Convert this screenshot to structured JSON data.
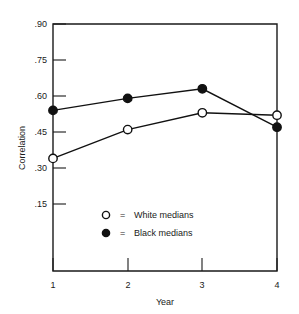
{
  "chart_data": {
    "type": "line",
    "title": "",
    "xlabel": "Year",
    "ylabel": "Correlation",
    "x": [
      1,
      2,
      3,
      4
    ],
    "xtick_labels": [
      "1",
      "2",
      "3",
      "4"
    ],
    "ytick_labels": [
      ".90",
      ".75",
      ".60",
      ".45",
      ".30",
      ".15"
    ],
    "ytick_values": [
      0.9,
      0.75,
      0.6,
      0.45,
      0.3,
      0.15
    ],
    "xlim": [
      1,
      4
    ],
    "ylim": [
      0.0,
      0.9
    ],
    "grid": false,
    "legend_position": "inside-lower-left",
    "series": [
      {
        "name": "White medians",
        "marker": "open-circle",
        "values": [
          0.34,
          0.46,
          0.53,
          0.52
        ]
      },
      {
        "name": "Black medians",
        "marker": "filled-circle",
        "values": [
          0.54,
          0.59,
          0.63,
          0.47
        ]
      }
    ],
    "legend": [
      {
        "symbol": "open-circle",
        "equals": "=",
        "label": "White  medians"
      },
      {
        "symbol": "filled-circle",
        "equals": "=",
        "label": "Black  medians"
      }
    ],
    "colors": {
      "line": "#111111",
      "open_marker_fill": "#ffffff",
      "filled_marker_fill": "#111111",
      "axis": "#1a1a1a",
      "background": "#ffffff"
    }
  },
  "axis": {
    "y_title": "Correlation",
    "x_title": "Year",
    "y_ticks": [
      {
        "label": ".90"
      },
      {
        "label": ".75"
      },
      {
        "label": ".60"
      },
      {
        "label": ".45"
      },
      {
        "label": ".30"
      },
      {
        "label": ".15"
      }
    ],
    "x_ticks": [
      {
        "label": "1"
      },
      {
        "label": "2"
      },
      {
        "label": "3"
      },
      {
        "label": "4"
      }
    ]
  },
  "legend": {
    "entries": [
      {
        "equals": "=",
        "label": "White  medians"
      },
      {
        "equals": "=",
        "label": "Black  medians"
      }
    ]
  }
}
